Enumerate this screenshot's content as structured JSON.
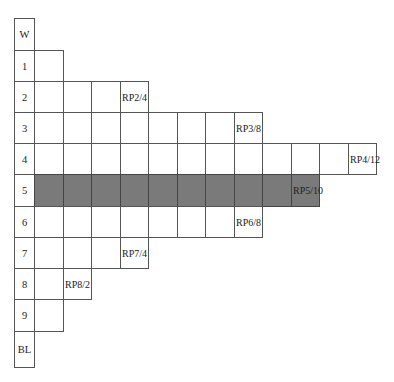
{
  "diagram": {
    "shade_color": "#7a7a7a",
    "rows": [
      {
        "label": "W",
        "cells": 0,
        "last_label": "",
        "shaded": false
      },
      {
        "label": "1",
        "cells": 1,
        "last_label": "",
        "shaded": false
      },
      {
        "label": "2",
        "cells": 4,
        "last_label": "RP2/4",
        "shaded": false
      },
      {
        "label": "3",
        "cells": 8,
        "last_label": "RP3/8",
        "shaded": false
      },
      {
        "label": "4",
        "cells": 12,
        "last_label": "RP4/12",
        "shaded": false
      },
      {
        "label": "5",
        "cells": 10,
        "last_label": "RP5/10",
        "shaded": true
      },
      {
        "label": "6",
        "cells": 8,
        "last_label": "RP6/8",
        "shaded": false
      },
      {
        "label": "7",
        "cells": 4,
        "last_label": "RP7/4",
        "shaded": false
      },
      {
        "label": "8",
        "cells": 2,
        "last_label": "RP8/2",
        "shaded": false
      },
      {
        "label": "9",
        "cells": 1,
        "last_label": "",
        "shaded": false
      },
      {
        "label": "BL",
        "cells": 0,
        "last_label": "",
        "shaded": false
      }
    ]
  }
}
